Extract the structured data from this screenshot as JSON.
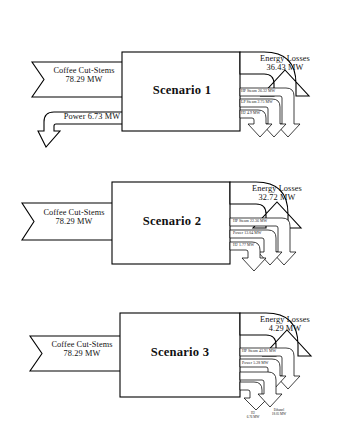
{
  "figure": {
    "type": "energy-flow-sankey-diagram",
    "scenario_count": 3,
    "units": "MW",
    "line_color": "#000000",
    "fill_color": "#ffffff"
  },
  "scenarios": [
    {
      "id": "scenario-1",
      "title": "Scenario 1",
      "inputs": [
        {
          "name": "coffee-cut-stems",
          "label": "Coffee Cut-Stems",
          "value": "78.29 MW"
        },
        {
          "name": "power-in",
          "label": "Power 6.73 MW",
          "value": "6.73 MW"
        }
      ],
      "losses": {
        "name": "energy-losses",
        "label": "Energy Losses",
        "value": "36.43 MW"
      },
      "outputs": [
        {
          "name": "hp-steam",
          "label": "HP Steam 26.32 MW",
          "value": "26.32 MW"
        },
        {
          "name": "lp-steam",
          "label": "LP Steam 2.75 MW",
          "value": "2.75 MW"
        },
        {
          "name": "hydrogen",
          "label": "H2 4.9 MW",
          "value": "4.9 MW"
        }
      ]
    },
    {
      "id": "scenario-2",
      "title": "Scenario 2",
      "inputs": [
        {
          "name": "coffee-cut-stems",
          "label": "Coffee Cut-Stems",
          "value": "78.29 MW"
        }
      ],
      "losses": {
        "name": "energy-losses",
        "label": "Energy Losses",
        "value": "32.72 MW"
      },
      "outputs": [
        {
          "name": "hp-steam",
          "label": "HP Steam 22.36 MW",
          "value": "22.36 MW"
        },
        {
          "name": "power-out",
          "label": "Power 13.04 MW",
          "value": "13.04 MW"
        },
        {
          "name": "hydrogen",
          "label": "H2 1.77 MW",
          "value": "1.77 MW"
        }
      ]
    },
    {
      "id": "scenario-3",
      "title": "Scenario 3",
      "inputs": [
        {
          "name": "coffee-cut-stems",
          "label": "Coffee Cut-Stems",
          "value": "78.29 MW"
        }
      ],
      "losses": {
        "name": "energy-losses",
        "label": "Energy Losses",
        "value": "4.29 MW"
      },
      "outputs": [
        {
          "name": "hp-steam",
          "label": "HP Steam 43.91 MW",
          "value": "43.91 MW"
        },
        {
          "name": "power-out",
          "label": "Power 5.28 MW",
          "value": "5.28 MW"
        },
        {
          "name": "hydrogen",
          "label": "H2",
          "value": "6.76 MW"
        },
        {
          "name": "ethanol",
          "label": "Ethanol",
          "value": "18.05 MW"
        }
      ]
    }
  ]
}
